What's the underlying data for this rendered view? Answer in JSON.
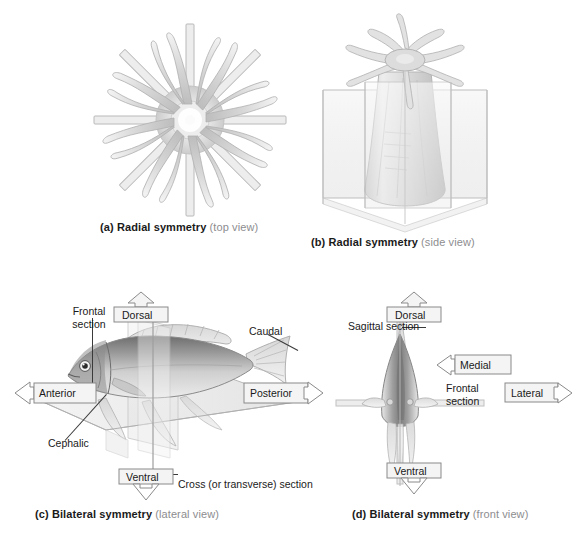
{
  "figure": {
    "background": "#ffffff",
    "text_color": "#1a1a1a",
    "subcaption_color": "#8d8d8f",
    "box_border_color": "#8a8a8a",
    "box_fill_color": "#f4f4f4"
  },
  "panels": [
    {
      "id": "a",
      "caption_lead": "(a) Radial symmetry",
      "caption_sub": "(top view)",
      "subject": "sea-anemone-top-view",
      "description": "Sea anemone seen from above with multiple vertical planes of symmetry radiating through the oral disc"
    },
    {
      "id": "b",
      "caption_lead": "(b) Radial symmetry",
      "caption_sub": "(side view)",
      "subject": "sea-anemone-side-view",
      "description": "Sea anemone seen from the side with two intersecting vertical planes of symmetry"
    },
    {
      "id": "c",
      "caption_lead": "(c) Bilateral symmetry",
      "caption_sub": "(lateral view)",
      "subject": "fish-lateral-view",
      "labels": {
        "dorsal": "Dorsal",
        "ventral": "Ventral",
        "anterior": "Anterior",
        "posterior": "Posterior",
        "frontal_section": "Frontal\nsection",
        "frontal_section_line1": "Frontal",
        "frontal_section_line2": "section",
        "caudal": "Caudal",
        "cephalic": "Cephalic",
        "cross_section": "Cross (or transverse) section"
      }
    },
    {
      "id": "d",
      "caption_lead": "(d) Bilateral symmetry",
      "caption_sub": "(front view)",
      "subject": "fish-front-view",
      "labels": {
        "dorsal": "Dorsal",
        "ventral": "Ventral",
        "medial": "Medial",
        "lateral": "Lateral",
        "sagittal_section": "Sagittal section",
        "frontal_section_line1": "Frontal",
        "frontal_section_line2": "section"
      }
    }
  ]
}
